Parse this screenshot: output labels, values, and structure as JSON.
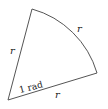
{
  "diagram": {
    "type": "circular-sector",
    "labels": {
      "left_radius": "r",
      "arc": "r",
      "bottom_radius": "r",
      "angle": "1 rad"
    },
    "colors": {
      "stroke": "#555555",
      "text": "#222222"
    }
  }
}
